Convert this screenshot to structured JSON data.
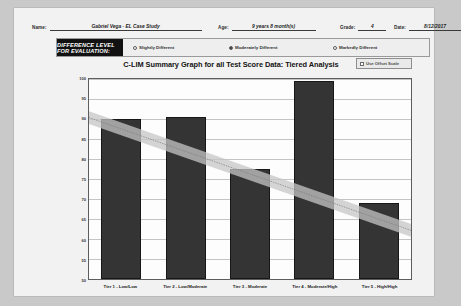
{
  "form": {
    "fields": [
      {
        "label": "Name:",
        "value": "Gabriel Vega - EL Case Study"
      },
      {
        "label": "Age:",
        "value": "9 years 8 month(s)"
      },
      {
        "label": "Grade:",
        "value": "4"
      },
      {
        "label": "Date:",
        "value": "8/12/2017"
      }
    ]
  },
  "difference_level": {
    "banner": "DIFFERENCE LEVEL FOR EVALUATION:",
    "options": [
      {
        "label": "Slightly Different",
        "selected": false
      },
      {
        "label": "Moderately Different",
        "selected": true
      },
      {
        "label": "Markedly Different",
        "selected": false
      }
    ]
  },
  "chart_header": {
    "title": "C-LIM Summary Graph for all Test Score Data: Tiered Analysis",
    "offset_toggle": {
      "label": "Use Offset Scale",
      "checked": false
    }
  },
  "chart_data": {
    "type": "bar",
    "title": "C-LIM Summary Graph for all Test Score Data: Tiered Analysis",
    "xlabel": "",
    "ylabel": "",
    "ylim": [
      50,
      100
    ],
    "yticks": [
      50,
      55,
      60,
      65,
      70,
      75,
      80,
      85,
      90,
      95,
      100
    ],
    "grid": true,
    "legend": "none",
    "categories": [
      "Tier 1 - Low/Low",
      "Tier 2 - Low/Moderate",
      "Tier 3 - Moderate",
      "Tier 4 - Moderate/High",
      "Tier 5 - High/High"
    ],
    "values": [
      90,
      90.5,
      77.5,
      99.5,
      69
    ],
    "bar_color": "#343434",
    "annotations": {
      "trend_band": {
        "description": "shaded expected-performance band declining left to right",
        "color": "#c6c6c6",
        "upper": [
          95,
          77.5
        ],
        "lower": [
          93,
          75.5
        ]
      },
      "trend_line": {
        "description": "dotted regression line through band",
        "style": "dotted",
        "color": "#7a7a7a",
        "start": 94,
        "end": 76.5
      }
    }
  }
}
